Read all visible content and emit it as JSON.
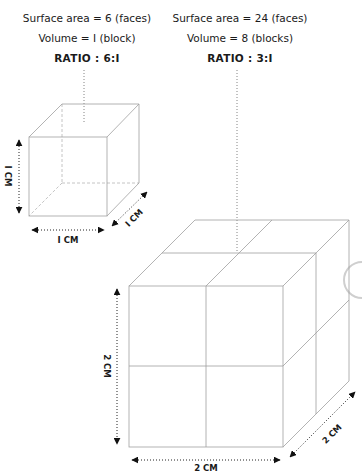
{
  "small_cube": {
    "surface_area": "Surface area = 6 (faces)",
    "volume": "Volume = I (block)",
    "ratio": "RATIO : 6:I",
    "dims": {
      "height": "I CM",
      "width": "I CM",
      "depth": "I CM"
    }
  },
  "large_cube": {
    "surface_area": "Surface area = 24 (faces)",
    "volume": "Volume = 8 (blocks)",
    "ratio": "RATIO : 3:I",
    "dims": {
      "height": "2 CM",
      "width": "2 CM",
      "depth": "2 CM"
    }
  },
  "colors": {
    "line": "#9a9a9a",
    "text": "#1a1a1a",
    "dots": "#6a6a6a"
  }
}
